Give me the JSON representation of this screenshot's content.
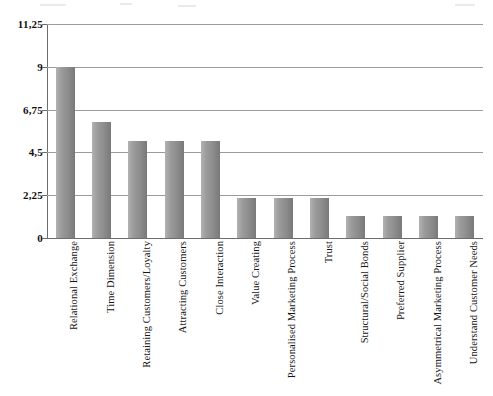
{
  "chart_data": {
    "type": "bar",
    "title": "",
    "subtitle": "",
    "xlabel": "",
    "ylabel": "",
    "ylim": [
      0,
      11.25
    ],
    "grid": true,
    "legend": false,
    "legend_position": "none",
    "decimal_separator": ",",
    "ytick_labels": [
      "0",
      "2,25",
      "4,5",
      "6,75",
      "9",
      "11,25"
    ],
    "ytick_values": [
      0,
      2.25,
      4.5,
      6.75,
      9,
      11.25
    ],
    "categories": [
      "Relational Exchange",
      "Time Dimension",
      "Retaining Customers/Loyalty",
      "Attracting Customers",
      "Close Interaction",
      "Value Creating",
      "Personalised Marketing Process",
      "Trust",
      "Structural/Social Bonds",
      "Preferred Supplier",
      "Asymmetrical Marketing Process",
      "Understand Customer Needs"
    ],
    "values": [
      9,
      6.1,
      5.1,
      5.1,
      5.1,
      2.1,
      2.1,
      2.1,
      1.15,
      1.15,
      1.15,
      1.15
    ],
    "bar_color": "#8e8e8e",
    "bar_color_light": "#b2b2b2",
    "bar_color_dark": "#797979",
    "gridline_color": "#9c9c9c",
    "axis_color": "#6d6d6d",
    "background_color": "#ffffff"
  }
}
